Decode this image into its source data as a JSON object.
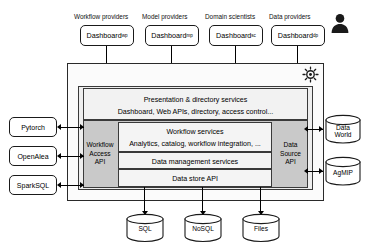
{
  "diagram": {
    "colors": {
      "outer_frame_bg": "#fbfbfb",
      "inner_shell_bg": "#eeeeee",
      "gray_band_bg": "#c9c9c9",
      "service_box_bg": "#f4f4f4",
      "stroke": "#2a2a2a",
      "person_icon": "#1a1a1a"
    }
  },
  "actors": {
    "items": [
      {
        "caption": "Workflow providers",
        "dashboard": "Dashboard",
        "subscript": "wp"
      },
      {
        "caption": "Model providers",
        "dashboard": "Dashboard",
        "subscript": "mp"
      },
      {
        "caption": "Domain scientists",
        "dashboard": "Dashboard",
        "subscript": "sc"
      },
      {
        "caption": "Data providers",
        "dashboard": "Dashboard",
        "subscript": "dp"
      }
    ],
    "user_icon": "person-icon"
  },
  "platform": {
    "settings_icon": "gear-icon",
    "presentation": {
      "title": "Presentation & directory services",
      "detail": "Dashboard, Web APIs, directory, access control..."
    },
    "left_api": {
      "lines": [
        "Workflow",
        "Access",
        "API"
      ]
    },
    "right_api": {
      "lines": [
        "Data",
        "Source",
        "API"
      ]
    },
    "services": [
      {
        "title": "Workflow services",
        "detail": "Analytics, catalog, workflow integration, ..."
      },
      {
        "title": "Data management services",
        "detail": ""
      },
      {
        "title": "Data store API",
        "detail": ""
      }
    ]
  },
  "left_tools": {
    "items": [
      {
        "label": "Pytorch"
      },
      {
        "label": "OpenAlea"
      },
      {
        "label": "SparkSQL"
      }
    ]
  },
  "right_sources": {
    "items": [
      {
        "label_line1": "Data",
        "label_line2": "World"
      },
      {
        "label_line1": "AgMIP",
        "label_line2": ""
      }
    ]
  },
  "bottom_stores": {
    "items": [
      {
        "label": "SQL"
      },
      {
        "label": "NoSQL"
      },
      {
        "label": "Files"
      }
    ]
  }
}
